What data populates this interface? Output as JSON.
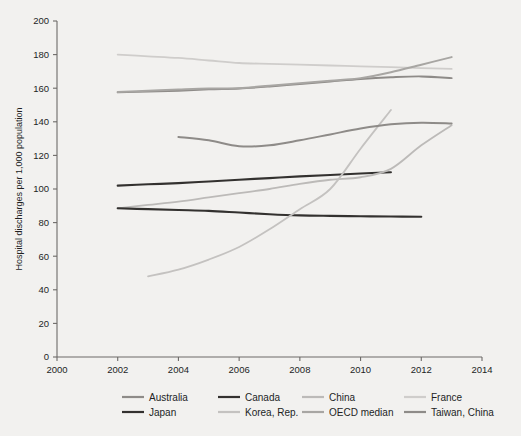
{
  "chart_data": {
    "type": "line",
    "title": "",
    "xlabel": "",
    "ylabel": "Hospital discharges per 1,000 population",
    "xlim": [
      2000,
      2014
    ],
    "ylim": [
      0,
      200
    ],
    "xticks": [
      2000,
      2002,
      2004,
      2006,
      2008,
      2010,
      2012,
      2014
    ],
    "yticks": [
      0,
      20,
      40,
      60,
      80,
      100,
      120,
      140,
      160,
      180,
      200
    ],
    "grid": false,
    "legend_position": "bottom",
    "series": [
      {
        "name": "Australia",
        "color": "#8e8b88",
        "width": 1.9,
        "x": [
          2002,
          2003,
          2004,
          2005,
          2006,
          2007,
          2008,
          2009,
          2010,
          2011,
          2012,
          2013
        ],
        "values": [
          157.5,
          158.0,
          158.5,
          159.3,
          159.8,
          161.0,
          162.5,
          164.0,
          165.5,
          166.5,
          167.0,
          166.0
        ]
      },
      {
        "name": "Canada",
        "color": "#33312f",
        "width": 2.1,
        "x": [
          2002,
          2003,
          2004,
          2005,
          2006,
          2007,
          2008,
          2009,
          2010,
          2011
        ],
        "values": [
          102.0,
          102.8,
          103.5,
          104.5,
          105.5,
          106.5,
          107.5,
          108.3,
          109.2,
          110.0
        ]
      },
      {
        "name": "China",
        "color": "#bcbab8",
        "width": 1.8,
        "x": [
          2002,
          2003,
          2004,
          2005,
          2006,
          2007,
          2008,
          2009,
          2010,
          2011,
          2012,
          2013
        ],
        "values": [
          88.5,
          90.5,
          92.5,
          95.0,
          97.5,
          100.0,
          103.0,
          105.5,
          107.0,
          112.0,
          126.0,
          138.0
        ]
      },
      {
        "name": "France",
        "color": "#cfcdcb",
        "width": 1.8,
        "x": [
          2002,
          2003,
          2004,
          2005,
          2006,
          2007,
          2008,
          2009,
          2010,
          2011,
          2012,
          2013
        ],
        "values": [
          180.0,
          179.0,
          178.0,
          176.5,
          175.0,
          174.5,
          174.0,
          173.5,
          173.0,
          172.5,
          172.0,
          171.5
        ]
      },
      {
        "name": "Japan",
        "color": "#33312f",
        "width": 2.1,
        "x": [
          2002,
          2003,
          2004,
          2005,
          2006,
          2007,
          2008,
          2009,
          2010,
          2011,
          2012
        ],
        "values": [
          88.5,
          88.0,
          87.5,
          87.0,
          86.0,
          85.0,
          84.3,
          84.0,
          83.8,
          83.6,
          83.5
        ]
      },
      {
        "name": "Korea, Rep.",
        "color": "#c4c2c0",
        "width": 1.8,
        "x": [
          2003,
          2004,
          2005,
          2006,
          2007,
          2008,
          2009,
          2010,
          2011
        ],
        "values": [
          48.0,
          52.0,
          58.0,
          65.5,
          76.0,
          88.0,
          100.0,
          124.0,
          147.0
        ]
      },
      {
        "name": "OECD median",
        "color": "#a8a6a3",
        "width": 2.0,
        "x": [
          2002,
          2003,
          2004,
          2005,
          2006,
          2007,
          2008,
          2009,
          2010,
          2011,
          2012,
          2013
        ],
        "values": [
          157.8,
          158.5,
          159.2,
          159.8,
          160.0,
          161.5,
          163.0,
          164.5,
          166.0,
          169.5,
          174.0,
          178.5
        ]
      },
      {
        "name": "Taiwan, China",
        "color": "#8e8b88",
        "width": 2.0,
        "x": [
          2004,
          2005,
          2006,
          2007,
          2008,
          2009,
          2010,
          2011,
          2012,
          2013
        ],
        "values": [
          131.0,
          129.0,
          125.5,
          126.0,
          129.0,
          132.5,
          136.0,
          138.5,
          139.5,
          139.0
        ]
      }
    ]
  },
  "axis": {
    "ylabel": "Hospital discharges per 1,000 population",
    "ytick_labels": [
      "0",
      "20",
      "40",
      "60",
      "80",
      "100",
      "120",
      "140",
      "160",
      "180",
      "200"
    ],
    "xtick_labels": [
      "2000",
      "2002",
      "2004",
      "2006",
      "2008",
      "2010",
      "2012",
      "2014"
    ]
  },
  "legend": {
    "row1": [
      {
        "label": "Australia",
        "color": "#8e8b88"
      },
      {
        "label": "Canada",
        "color": "#33312f"
      },
      {
        "label": "China",
        "color": "#bcbab8"
      },
      {
        "label": "France",
        "color": "#cfcdcb"
      }
    ],
    "row2": [
      {
        "label": "Japan",
        "color": "#33312f"
      },
      {
        "label": "Korea, Rep.",
        "color": "#c4c2c0"
      },
      {
        "label": "OECD median",
        "color": "#a8a6a3"
      },
      {
        "label": "Taiwan, China",
        "color": "#8e8b88"
      }
    ]
  },
  "colors": {
    "background": "#f2f1ef",
    "axis": "#6d6a68",
    "text": "#221f1f"
  }
}
